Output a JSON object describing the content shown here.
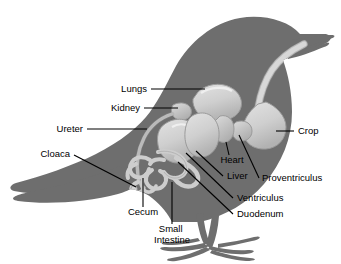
{
  "figure": {
    "style": "grayscale silhouette cutaway",
    "colors": {
      "background": "#ffffff",
      "body": "#6e6e6e",
      "body_shadow": "#5e5e5e",
      "organ_light": "#d4d4d4",
      "organ_mid": "#bdbdbd",
      "organ_dark": "#a8a8a8",
      "organ_outline": "#8a8a8a",
      "leader_line": "#000000",
      "label_text": "#000000"
    }
  },
  "labels": [
    {
      "id": "lungs",
      "text": "Lungs",
      "anchor": "end",
      "x": 147,
      "y": 92,
      "leader": "M 151 89 L 205 89"
    },
    {
      "id": "kidney",
      "text": "Kidney",
      "anchor": "end",
      "x": 140,
      "y": 111,
      "leader": "M 144 108 L 178 108"
    },
    {
      "id": "ureter",
      "text": "Ureter",
      "anchor": "end",
      "x": 83,
      "y": 132,
      "leader": "M 87 129 L 147 129"
    },
    {
      "id": "cloaca",
      "text": "Cloaca",
      "anchor": "end",
      "x": 70,
      "y": 157,
      "leader": "M 74 155 L 136 187"
    },
    {
      "id": "cecum",
      "text": "Cecum",
      "anchor": "middle",
      "x": 143,
      "y": 215,
      "leader": "M 143 207 L 143 178"
    },
    {
      "id": "small-intestine",
      "text": "Small Intestine",
      "anchor": "middle",
      "x": 172,
      "y": 232,
      "leader": "M 172 224 L 172 182"
    },
    {
      "id": "crop",
      "text": "Crop",
      "anchor": "start",
      "x": 298,
      "y": 134,
      "leader": "M 294 131 L 276 131"
    },
    {
      "id": "heart",
      "text": "Heart",
      "anchor": "middle",
      "x": 232,
      "y": 163,
      "leader": "M 229 155 L 226 142"
    },
    {
      "id": "liver",
      "text": "Liver",
      "anchor": "start",
      "x": 227,
      "y": 179,
      "leader": "M 223 176 L 196 151"
    },
    {
      "id": "proventriculus",
      "text": "Proventriculus",
      "anchor": "start",
      "x": 262,
      "y": 181,
      "leader": "M 259 178 L 239 135"
    },
    {
      "id": "ventriculus",
      "text": "Ventriculus",
      "anchor": "start",
      "x": 237,
      "y": 201,
      "leader": "M 233 198 L 186 153"
    },
    {
      "id": "duodenum",
      "text": "Duodenum",
      "anchor": "start",
      "x": 237,
      "y": 217,
      "leader": "M 233 214 L 178 162"
    }
  ],
  "organs": [
    {
      "id": "lungs",
      "name": "Lungs"
    },
    {
      "id": "kidney",
      "name": "Kidney"
    },
    {
      "id": "ureter",
      "name": "Ureter"
    },
    {
      "id": "cloaca",
      "name": "Cloaca"
    },
    {
      "id": "cecum",
      "name": "Cecum"
    },
    {
      "id": "small-intestine",
      "name": "Small Intestine"
    },
    {
      "id": "crop",
      "name": "Crop"
    },
    {
      "id": "heart",
      "name": "Heart"
    },
    {
      "id": "liver",
      "name": "Liver"
    },
    {
      "id": "proventriculus",
      "name": "Proventriculus"
    },
    {
      "id": "ventriculus",
      "name": "Ventriculus"
    },
    {
      "id": "duodenum",
      "name": "Duodenum"
    }
  ]
}
